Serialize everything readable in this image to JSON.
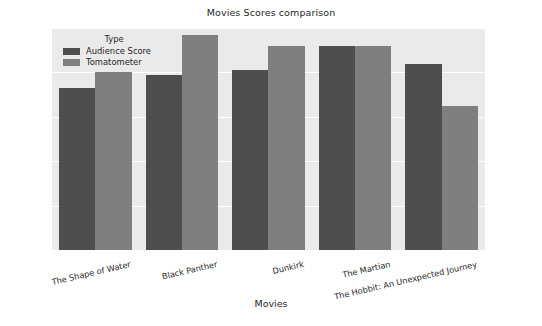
{
  "chart_data": {
    "type": "bar",
    "title": "Movies Scores comparison",
    "xlabel": "Movies",
    "ylabel": "Scores",
    "categories": [
      "The Shape of Water",
      "Black Panther",
      "Dunkirk",
      "The Martian",
      "The Hobbit: An Unexpected Journey"
    ],
    "series": [
      {
        "name": "Audience Score",
        "color": "#4e4e4e",
        "values": [
          73,
          79,
          81,
          92,
          84
        ]
      },
      {
        "name": "Tomatometer",
        "color": "#7f7f7f",
        "values": [
          80,
          97,
          92,
          92,
          65
        ]
      }
    ],
    "ylim": [
      0,
      100
    ],
    "yticks": [
      0,
      20,
      40,
      60,
      80,
      100
    ],
    "grid": true,
    "legend": {
      "title": "Type",
      "position": "upper-left"
    },
    "plot_background": "#eaeaea"
  }
}
